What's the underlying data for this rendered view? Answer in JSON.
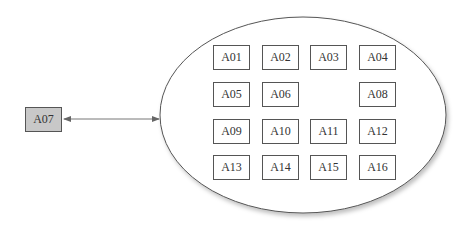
{
  "external_node": {
    "label": "A07",
    "fill": "#c8c8c8"
  },
  "container": {
    "shape": "ellipse"
  },
  "connector": {
    "type": "bidirectional-arrow",
    "from": "A07",
    "to": "container"
  },
  "grid": [
    [
      "A01",
      "A02",
      "A03",
      "A04"
    ],
    [
      "A05",
      "A06",
      "",
      "A08"
    ],
    [
      "A09",
      "A10",
      "A11",
      "A12"
    ],
    [
      "A13",
      "A14",
      "A15",
      "A16"
    ]
  ]
}
